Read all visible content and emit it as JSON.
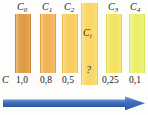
{
  "figure": {
    "title": "",
    "axis_symbol": "C",
    "unknown_marker": "?",
    "background": "#fdfdfb",
    "arrow_color": "#3b6ec0"
  },
  "chart_data": {
    "type": "bar",
    "title": "",
    "xlabel": "C",
    "ylabel": "",
    "grid": false,
    "legend": null,
    "categories": [
      "C0",
      "C1",
      "C2",
      "Ci",
      "C3",
      "C4"
    ],
    "category_labels": [
      "C",
      "C",
      "C",
      "C",
      "C",
      "C"
    ],
    "category_subscripts": [
      "0",
      "1",
      "2",
      "i",
      "3",
      "4"
    ],
    "values": [
      1.0,
      0.8,
      0.5,
      null,
      0.25,
      0.1
    ],
    "value_labels": [
      "1,0",
      "0,8",
      "0,5",
      "?",
      "0,25",
      "0,1"
    ],
    "colors": [
      "#e09a42",
      "#f2b košík"
    ]
  },
  "bars": [
    {
      "id": "bar-c0",
      "top_label": "C",
      "top_sub": "0",
      "value_label": "1,0",
      "color": "#df9a3f",
      "edge": "#cf8a31",
      "x": 15,
      "y": 14,
      "w": 16,
      "h": 59,
      "inner_label": "",
      "inner_sub": ""
    },
    {
      "id": "bar-c1",
      "top_label": "C",
      "top_sub": "1",
      "value_label": "0,8",
      "color": "#f2b154",
      "edge": "#e3a244",
      "x": 40,
      "y": 14,
      "w": 16,
      "h": 59,
      "inner_label": "",
      "inner_sub": ""
    },
    {
      "id": "bar-c2",
      "top_label": "C",
      "top_sub": "2",
      "value_label": "0,5",
      "color": "#f7cc5c",
      "edge": "#eabd4d",
      "x": 62,
      "y": 14,
      "w": 16,
      "h": 59,
      "inner_label": "",
      "inner_sub": ""
    },
    {
      "id": "bar-ci",
      "top_label": "",
      "top_sub": "",
      "value_label": "?",
      "color": "#fad764",
      "edge": "#edca56",
      "x": 81,
      "y": 3,
      "w": 17,
      "h": 82,
      "inner_label": "C",
      "inner_sub": "i"
    },
    {
      "id": "bar-c3",
      "top_label": "C",
      "top_sub": "3",
      "value_label": "0,25",
      "color": "#f3e35e",
      "edge": "#e6d64f",
      "x": 106,
      "y": 14,
      "w": 16,
      "h": 59,
      "inner_label": "",
      "inner_sub": ""
    },
    {
      "id": "bar-c4",
      "top_label": "C",
      "top_sub": "4",
      "value_label": "0,1",
      "color": "#e9ef68",
      "edge": "#dbe25a",
      "x": 129,
      "y": 14,
      "w": 16,
      "h": 59,
      "inner_label": "",
      "inner_sub": ""
    }
  ],
  "labels": {
    "axis_symbol": "C",
    "top": [
      "C",
      "C",
      "C",
      "C",
      "C"
    ],
    "bottom_values": [
      "1,0",
      "0,8",
      "0,5",
      "0,25",
      "0,1"
    ],
    "unknown": "?",
    "unknown_bar_label": "C"
  }
}
